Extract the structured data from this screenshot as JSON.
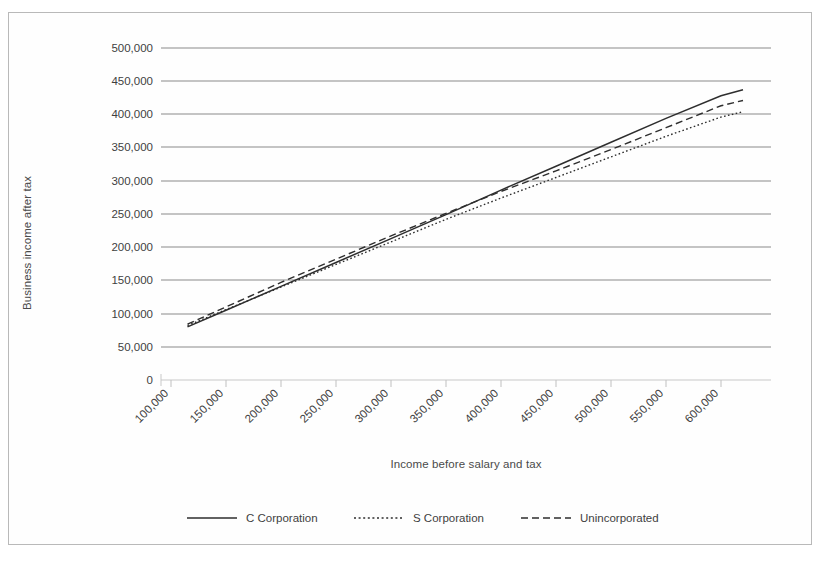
{
  "chart_data": {
    "type": "line",
    "title": "",
    "xlabel": "Income before salary and tax",
    "ylabel": "Business income after tax",
    "xlim": [
      75000,
      625000
    ],
    "ylim": [
      0,
      500000
    ],
    "grid": true,
    "legend_position": "bottom",
    "xticks": [
      "100,000",
      "150,000",
      "200,000",
      "250,000",
      "300,000",
      "350,000",
      "400,000",
      "450,000",
      "500,000",
      "550,000",
      "600,000"
    ],
    "xtick_values": [
      100000,
      150000,
      200000,
      250000,
      300000,
      350000,
      400000,
      450000,
      500000,
      550000,
      600000
    ],
    "yticks": [
      "0",
      "50,000",
      "100,000",
      "150,000",
      "200,000",
      "250,000",
      "300,000",
      "350,000",
      "400,000",
      "450,000",
      "500,000"
    ],
    "ytick_values": [
      0,
      50000,
      100000,
      150000,
      200000,
      250000,
      300000,
      350000,
      400000,
      450000,
      500000
    ],
    "x": [
      115000,
      150000,
      200000,
      250000,
      300000,
      350000,
      400000,
      450000,
      500000,
      550000,
      600000,
      620000
    ],
    "series": [
      {
        "name": "C Corporation",
        "style": "solid",
        "color": "#2e2e2e",
        "values": [
          80000,
          105000,
          141000,
          177000,
          213000,
          249000,
          286000,
          322000,
          358000,
          394000,
          428000,
          437000
        ]
      },
      {
        "name": "S Corporation",
        "style": "dotted",
        "color": "#2e2e2e",
        "values": [
          82000,
          106000,
          140000,
          174000,
          208000,
          242000,
          274000,
          305000,
          336000,
          367000,
          396000,
          404000
        ]
      },
      {
        "name": "Unincorporated",
        "style": "dashed",
        "color": "#2e2e2e",
        "values": [
          84000,
          110000,
          147000,
          182000,
          217000,
          251000,
          284000,
          315000,
          347000,
          380000,
          413000,
          421000
        ]
      }
    ]
  },
  "legend": {
    "items": [
      {
        "label": "C Corporation",
        "style": "solid"
      },
      {
        "label": "S Corporation",
        "style": "dotted"
      },
      {
        "label": "Unincorporated",
        "style": "dashed"
      }
    ]
  }
}
